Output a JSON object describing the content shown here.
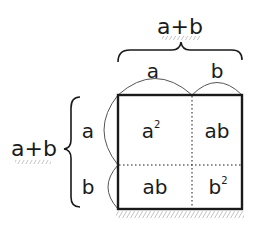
{
  "diagram": {
    "top_label": "a+b",
    "top_segments": [
      "a",
      "b"
    ],
    "left_label": "a+b",
    "left_segments": [
      "a",
      "b"
    ],
    "cells": [
      {
        "row": 0,
        "col": 0,
        "label": "a",
        "sup": "2"
      },
      {
        "row": 0,
        "col": 1,
        "label": "ab",
        "sup": ""
      },
      {
        "row": 1,
        "col": 0,
        "label": "ab",
        "sup": ""
      },
      {
        "row": 1,
        "col": 1,
        "label": "b",
        "sup": "2"
      }
    ],
    "colors": {
      "ink": "#1a1a1a",
      "arc": "#555555",
      "hatch": "#888888",
      "background": "#ffffff"
    }
  }
}
